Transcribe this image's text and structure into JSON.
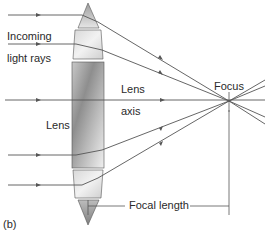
{
  "figure": {
    "panel_label": "(b)",
    "labels": {
      "incoming_line1": "Incoming",
      "incoming_line2": "light rays",
      "lens": "Lens",
      "lens_axis_line1": "Lens",
      "lens_axis_line2": "axis",
      "focus": "Focus",
      "focal_length": "Focal length"
    },
    "colors": {
      "ray": "#555555",
      "lens_light": "#eeeeee",
      "lens_dark": "#9a9a9a",
      "lens_outline": "#444444",
      "text": "#2a2a2a"
    },
    "rays": [
      {
        "entry_y": 15,
        "exit_y": 22
      },
      {
        "entry_y": 44,
        "exit_y": 50
      },
      {
        "entry_y": 100,
        "exit_y": 100
      },
      {
        "entry_y": 155,
        "exit_y": 150
      },
      {
        "entry_y": 185,
        "exit_y": 178
      }
    ],
    "focus_point": {
      "x": 229,
      "y": 101
    }
  }
}
